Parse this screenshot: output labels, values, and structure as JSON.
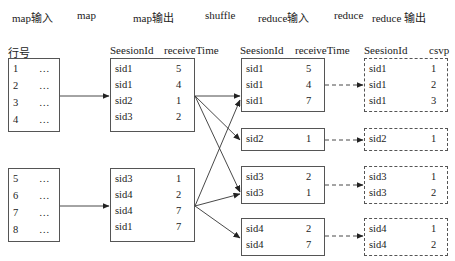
{
  "stages": [
    "map输入",
    "map",
    "map输出",
    "shuffle",
    "reduce输入",
    "reduce",
    "reduce 输出"
  ],
  "input": {
    "header": "行号",
    "blocks": [
      {
        "rows": [
          {
            "id": "1",
            "val": "…"
          },
          {
            "id": "2",
            "val": "…"
          },
          {
            "id": "3",
            "val": "…"
          },
          {
            "id": "4",
            "val": "…"
          }
        ]
      },
      {
        "rows": [
          {
            "id": "5",
            "val": "…"
          },
          {
            "id": "6",
            "val": "…"
          },
          {
            "id": "7",
            "val": "…"
          },
          {
            "id": "8",
            "val": "…"
          }
        ]
      }
    ]
  },
  "map_output": {
    "headers": [
      "SeesionId",
      "receiveTime"
    ],
    "blocks": [
      {
        "rows": [
          {
            "sid": "sid1",
            "t": "5"
          },
          {
            "sid": "sid1",
            "t": "4"
          },
          {
            "sid": "sid2",
            "t": "1"
          },
          {
            "sid": "sid3",
            "t": "2"
          }
        ]
      },
      {
        "rows": [
          {
            "sid": "sid3",
            "t": "1"
          },
          {
            "sid": "sid4",
            "t": "2"
          },
          {
            "sid": "sid4",
            "t": "7"
          },
          {
            "sid": "sid1",
            "t": "7"
          }
        ]
      }
    ]
  },
  "reduce_input": {
    "headers": [
      "SeesionId",
      "receiveTime"
    ],
    "blocks": [
      {
        "rows": [
          {
            "sid": "sid1",
            "t": "5"
          },
          {
            "sid": "sid1",
            "t": "4"
          },
          {
            "sid": "sid1",
            "t": "7"
          }
        ]
      },
      {
        "rows": [
          {
            "sid": "sid2",
            "t": "1"
          }
        ]
      },
      {
        "rows": [
          {
            "sid": "sid3",
            "t": "2"
          },
          {
            "sid": "sid3",
            "t": "1"
          }
        ]
      },
      {
        "rows": [
          {
            "sid": "sid4",
            "t": "2"
          },
          {
            "sid": "sid4",
            "t": "7"
          }
        ]
      }
    ]
  },
  "reduce_output": {
    "headers": [
      "SeesionId",
      "csvp"
    ],
    "blocks": [
      {
        "rows": [
          {
            "sid": "sid1",
            "v": "1"
          },
          {
            "sid": "sid1",
            "v": "2"
          },
          {
            "sid": "sid1",
            "v": "3"
          }
        ]
      },
      {
        "rows": [
          {
            "sid": "sid2",
            "v": "1"
          }
        ]
      },
      {
        "rows": [
          {
            "sid": "sid3",
            "v": "1"
          },
          {
            "sid": "sid3",
            "v": "2"
          }
        ]
      },
      {
        "rows": [
          {
            "sid": "sid4",
            "v": "1"
          },
          {
            "sid": "sid4",
            "v": "2"
          }
        ]
      }
    ]
  },
  "colors": {
    "line": "#333333",
    "border": "#555555"
  }
}
